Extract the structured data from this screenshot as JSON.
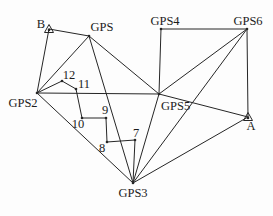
{
  "diagram": {
    "background_color": "#fdfdfd",
    "line_color": "#262626",
    "text_color": "#1c1c1c",
    "nodes": [
      {
        "id": "B",
        "label": "B",
        "x": 49,
        "y": 29,
        "marker": "triangle",
        "label_x": 45,
        "label_y": 28,
        "anchor": "end"
      },
      {
        "id": "GPS",
        "label": "GPS",
        "x": 89,
        "y": 36,
        "marker": "dot",
        "label_x": 102,
        "label_y": 31,
        "anchor": "middle"
      },
      {
        "id": "GPS4",
        "label": "GPS4",
        "x": 161,
        "y": 29,
        "marker": "dot",
        "label_x": 165,
        "label_y": 25,
        "anchor": "middle"
      },
      {
        "id": "GPS6",
        "label": "GPS6",
        "x": 247,
        "y": 29,
        "marker": "dot",
        "label_x": 248,
        "label_y": 25,
        "anchor": "middle"
      },
      {
        "id": "GPS2",
        "label": "GPS2",
        "x": 37,
        "y": 93,
        "marker": "dot",
        "label_x": 23,
        "label_y": 107,
        "anchor": "middle"
      },
      {
        "id": "GPS5",
        "label": "GPS5",
        "x": 159,
        "y": 94,
        "marker": "dot",
        "label_x": 161,
        "label_y": 110,
        "anchor": "start"
      },
      {
        "id": "A",
        "label": "A",
        "x": 248,
        "y": 117,
        "marker": "triangle",
        "label_x": 251,
        "label_y": 130,
        "anchor": "middle"
      },
      {
        "id": "GPS3",
        "label": "GPS3",
        "x": 133,
        "y": 183,
        "marker": "dot",
        "label_x": 133,
        "label_y": 197,
        "anchor": "middle"
      },
      {
        "id": "12",
        "label": "12",
        "x": 62,
        "y": 81,
        "marker": "dot",
        "label_x": 69,
        "label_y": 79,
        "anchor": "middle"
      },
      {
        "id": "11",
        "label": "11",
        "x": 76,
        "y": 89,
        "marker": "dot",
        "label_x": 84,
        "label_y": 88,
        "anchor": "middle"
      },
      {
        "id": "10",
        "label": "10",
        "x": 82,
        "y": 118,
        "marker": "dot",
        "label_x": 78,
        "label_y": 128,
        "anchor": "middle"
      },
      {
        "id": "9",
        "label": "9",
        "x": 106,
        "y": 118,
        "marker": "dot",
        "label_x": 105,
        "label_y": 114,
        "anchor": "middle"
      },
      {
        "id": "8",
        "label": "8",
        "x": 107,
        "y": 142,
        "marker": "dot",
        "label_x": 102,
        "label_y": 152,
        "anchor": "middle"
      },
      {
        "id": "7",
        "label": "7",
        "x": 135,
        "y": 140,
        "marker": "dot",
        "label_x": 136,
        "label_y": 137,
        "anchor": "middle"
      }
    ],
    "edges": [
      [
        "B",
        "GPS"
      ],
      [
        "B",
        "GPS2"
      ],
      [
        "GPS2",
        "GPS"
      ],
      [
        "GPS",
        "GPS5"
      ],
      [
        "GPS",
        "GPS3"
      ],
      [
        "GPS2",
        "GPS5"
      ],
      [
        "GPS2",
        "GPS3"
      ],
      [
        "GPS4",
        "GPS6"
      ],
      [
        "GPS4",
        "GPS5"
      ],
      [
        "GPS5",
        "GPS6"
      ],
      [
        "GPS5",
        "GPS3"
      ],
      [
        "GPS5",
        "A"
      ],
      [
        "GPS6",
        "A"
      ],
      [
        "GPS6",
        "GPS3"
      ],
      [
        "GPS3",
        "A"
      ],
      [
        "GPS2",
        "12"
      ],
      [
        "12",
        "11"
      ],
      [
        "11",
        "10"
      ],
      [
        "10",
        "9"
      ],
      [
        "9",
        "8"
      ],
      [
        "8",
        "7"
      ],
      [
        "7",
        "GPS3"
      ]
    ]
  }
}
